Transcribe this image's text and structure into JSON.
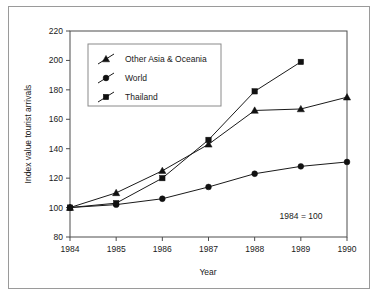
{
  "chart_data": {
    "type": "line",
    "title": "",
    "xlabel": "Year",
    "ylabel": "Index value tourist arrivals",
    "annotation": "1984 = 100",
    "x": [
      1984,
      1985,
      1986,
      1987,
      1988,
      1989,
      1990
    ],
    "xtick_labels": [
      "1984",
      "1985",
      "1986",
      "1987",
      "1988",
      "1989",
      "1990"
    ],
    "ytick_labels": [
      "80",
      "100",
      "120",
      "140",
      "160",
      "180",
      "200",
      "220"
    ],
    "yticks": [
      80,
      100,
      120,
      140,
      160,
      180,
      200,
      220
    ],
    "xlim": [
      1984,
      1990
    ],
    "ylim": [
      80,
      220
    ],
    "grid": false,
    "legend_position": "upper-left-inside",
    "series": [
      {
        "name": "Other Asia & Oceania",
        "marker": "triangle",
        "x": [
          1984,
          1985,
          1986,
          1987,
          1988,
          1989,
          1990
        ],
        "values": [
          100,
          110,
          125,
          143,
          166,
          167,
          175
        ]
      },
      {
        "name": "World",
        "marker": "circle",
        "x": [
          1984,
          1985,
          1986,
          1987,
          1988,
          1989,
          1990
        ],
        "values": [
          100,
          102,
          106,
          114,
          123,
          128,
          131
        ]
      },
      {
        "name": "Thailand",
        "marker": "square",
        "x": [
          1984,
          1985,
          1986,
          1987,
          1988,
          1989
        ],
        "values": [
          100,
          103,
          120,
          146,
          179,
          199
        ]
      }
    ]
  },
  "legend": {
    "entries": [
      {
        "label": "Other Asia & Oceania"
      },
      {
        "label": "World"
      },
      {
        "label": "Thailand"
      }
    ]
  },
  "colors": {
    "ink": "#1a1a1a",
    "axis": "#4c4c4c",
    "frame": "#9a9a9a",
    "background": "#ffffff"
  }
}
